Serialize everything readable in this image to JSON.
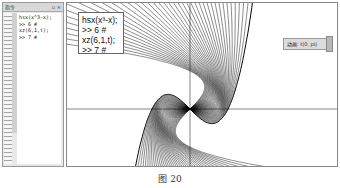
{
  "command_panel": {
    "title": "指令",
    "controls": "▫ ×",
    "lines": [
      "hsx(x^3-x);",
      ">> 6 #",
      "xz(6,1,t);",
      ">> 7 #"
    ]
  },
  "plot": {
    "script_lines": [
      "hsx(x³-x);",
      ">> 6 #",
      "xz(6,1,t);",
      ">> 7 #"
    ],
    "animation_button": "动画: t(0, pi)",
    "function": "x^3-x",
    "rotation_copies": 40,
    "line_color": "#000000"
  },
  "caption": "图 20"
}
